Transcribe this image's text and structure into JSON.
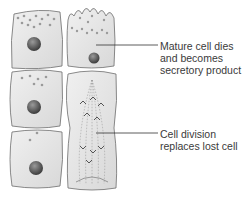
{
  "diagram": {
    "type": "holocrine secretion illustration",
    "labels": [
      {
        "id": "mature",
        "lines": [
          "Mature cell dies",
          "and becomes",
          "secretory product"
        ]
      },
      {
        "id": "division",
        "lines": [
          "Cell division",
          "replaces lost cell"
        ]
      }
    ],
    "colors": {
      "cell_fill": "#e6e6e6",
      "cell_outline": "#6d6d6d",
      "nucleus": "#4a4a4a",
      "granule": "#9a9a9a",
      "text": "#3a3a3a",
      "leader_line": "#333333"
    }
  }
}
